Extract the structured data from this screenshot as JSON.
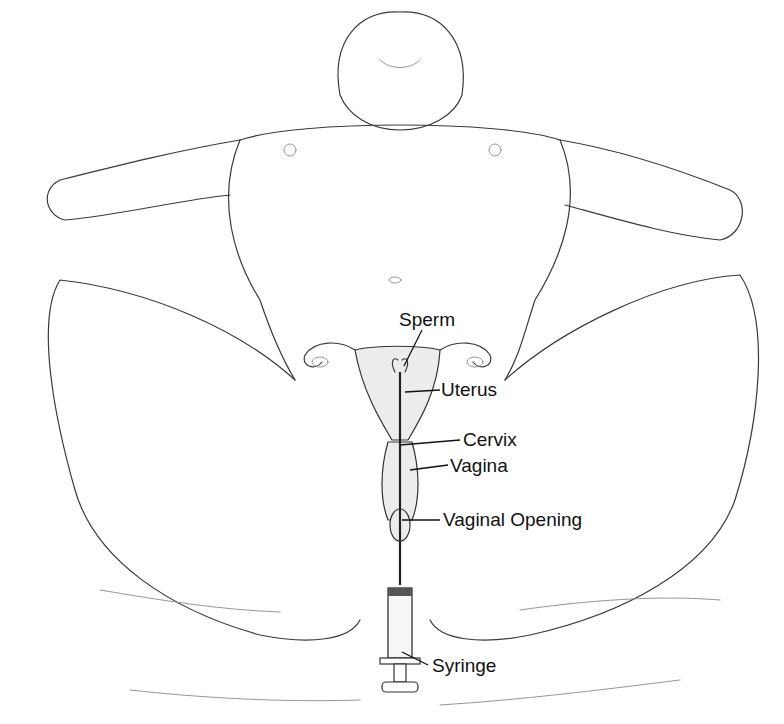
{
  "illustration": {
    "subject": "Artificial insemination procedure",
    "style": "black-and-white line drawing"
  },
  "labels": {
    "sperm": "Sperm",
    "uterus": "Uterus",
    "cervix": "Cervix",
    "vagina": "Vagina",
    "vaginal_opening": "Vaginal Opening",
    "syringe": "Syringe"
  }
}
